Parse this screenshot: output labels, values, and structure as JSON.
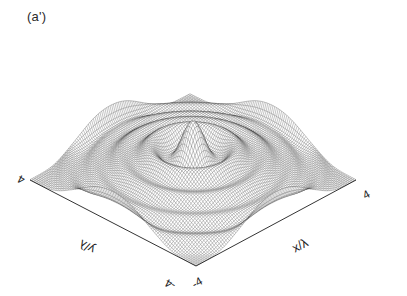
{
  "figure": {
    "panel_label": "(a')",
    "background_color": "#ffffff",
    "line_color": "#222222"
  },
  "chart_data": {
    "type": "surface",
    "render": "wireframe-mesh-3d",
    "title": "(a')",
    "xlabel": "x/λ",
    "ylabel": "y/λ",
    "zlabel": "",
    "xlim": [
      -4,
      4
    ],
    "ylim": [
      -4,
      4
    ],
    "zlim": [
      0,
      1
    ],
    "xticks": [
      -4,
      4
    ],
    "yticks": [
      -4,
      4
    ],
    "xticklabels": [
      "-4",
      "4"
    ],
    "yticklabels": [
      "-4",
      "4"
    ],
    "grid": false,
    "legend": null,
    "projection": {
      "azimuth_deg": 45,
      "elevation_deg": 28,
      "base_left_vertex": [
        30,
        180
      ],
      "base_right_vertex": [
        356,
        180
      ],
      "base_front_vertex": [
        196,
        266
      ],
      "base_back_vertex": [
        193,
        96
      ]
    },
    "mesh": {
      "nx": 96,
      "ny": 96,
      "stroke_width": 0.32,
      "opacity": 0.85
    },
    "surface_function": {
      "description": "Radially symmetric diffraction-like intensity: tall central peak with concentric ring terraces and four raised outer lobes",
      "formula": "z(r,theta) = 0.30*exp(-((r-0.0)/0.62)^2) + 0.165*exp(-((r-1.52)/0.55)^2) + 0.115*exp(-((r-2.55)/0.52)^2) + 0.075*exp(-((r-3.45)/0.42)^2) + 0.26*exp(-((r-4.35)/0.42)^2)*cos(2*theta)^6 + 0.055*exp(-((r-4.35)/0.45)^2)",
      "r_definition": "r = sqrt(x^2 + y^2)",
      "theta_definition": "theta = atan2(y, x)",
      "peak_height_normalized": 1.0,
      "ring_radii": [
        0.0,
        1.52,
        2.55,
        3.45,
        4.35
      ],
      "ring_amplitudes": [
        0.3,
        0.165,
        0.115,
        0.075,
        0.26
      ],
      "outer_lobe_count": 4
    },
    "annotations": [
      {
        "text": "(a')",
        "x_px": 27,
        "y_px": 9,
        "role": "panel-label"
      },
      {
        "text": "4",
        "role": "y-axis-max-tick"
      },
      {
        "text": "4",
        "role": "x-axis-max-tick"
      },
      {
        "text": "-4",
        "role": "y-axis-min-tick"
      },
      {
        "text": "-4",
        "role": "x-axis-min-tick"
      },
      {
        "text": "y/λ",
        "role": "y-axis-title"
      },
      {
        "text": "x/λ",
        "role": "x-axis-title"
      }
    ]
  }
}
